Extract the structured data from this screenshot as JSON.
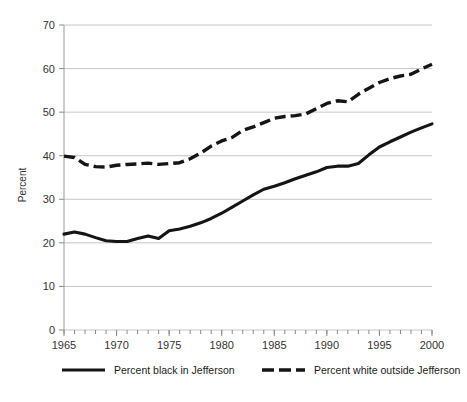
{
  "chart_data": {
    "type": "line",
    "title": "",
    "xlabel": "",
    "ylabel": "Percent",
    "xlim": [
      1965,
      2000
    ],
    "ylim": [
      0,
      70
    ],
    "ytick_step": 10,
    "xtick_step": 5,
    "minor_xtick_step": 1,
    "grid": "horizontal",
    "legend_position": "bottom",
    "yticks": [
      "0",
      "10",
      "20",
      "30",
      "40",
      "50",
      "60",
      "70"
    ],
    "xticks": [
      "1965",
      "1970",
      "1975",
      "1980",
      "1985",
      "1990",
      "1995",
      "2000"
    ],
    "x": [
      1965,
      1966,
      1967,
      1968,
      1969,
      1970,
      1971,
      1972,
      1973,
      1974,
      1975,
      1976,
      1977,
      1978,
      1979,
      1980,
      1981,
      1982,
      1983,
      1984,
      1985,
      1986,
      1987,
      1988,
      1989,
      1990,
      1991,
      1992,
      1993,
      1994,
      1995,
      1996,
      1997,
      1998,
      1999,
      2000
    ],
    "series": [
      {
        "name": "Percent black in Jefferson",
        "style": "solid",
        "color": "#151515",
        "values": [
          22.0,
          22.5,
          22.0,
          21.2,
          20.5,
          20.3,
          20.3,
          21.0,
          21.6,
          21.0,
          22.8,
          23.2,
          23.8,
          24.6,
          25.6,
          26.8,
          28.2,
          29.6,
          31.0,
          32.3,
          33.0,
          33.8,
          34.7,
          35.5,
          36.3,
          37.3,
          37.6,
          37.6,
          38.2,
          40.2,
          42.0,
          43.2,
          44.3,
          45.4,
          46.4,
          47.3
        ]
      },
      {
        "name": "Percent white outside Jefferson",
        "style": "dashed",
        "color": "#151515",
        "values": [
          39.9,
          39.6,
          38.0,
          37.5,
          37.4,
          37.8,
          38.0,
          38.1,
          38.3,
          38.0,
          38.2,
          38.4,
          39.3,
          40.6,
          42.2,
          43.4,
          44.2,
          45.8,
          46.6,
          47.6,
          48.6,
          49.0,
          49.2,
          49.6,
          50.8,
          52.0,
          52.6,
          52.4,
          54.1,
          55.5,
          56.8,
          57.7,
          58.3,
          58.7,
          59.9,
          61.0
        ]
      }
    ]
  },
  "legend": {
    "items": [
      {
        "label": "Percent black in Jefferson",
        "style": "solid"
      },
      {
        "label": "Percent white outside Jefferson",
        "style": "dashed"
      }
    ]
  },
  "axes": {
    "y_title": "Percent"
  }
}
